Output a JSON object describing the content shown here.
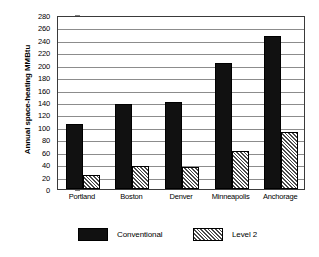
{
  "chart_data": {
    "type": "bar",
    "title": "",
    "xlabel": "",
    "ylabel": "Annual space-heating MMBtu",
    "ylabel_parts": {
      "text": "Annual space-heating",
      "unit": "MMBtu"
    },
    "categories": [
      "Portland",
      "Boston",
      "Denver",
      "Minneapolis",
      "Anchorage"
    ],
    "series": [
      {
        "name": "Conventional",
        "values": [
          105,
          137,
          140,
          202,
          246
        ],
        "pattern": "solid-black",
        "color": "#111111"
      },
      {
        "name": "Level 2",
        "values": [
          22,
          37,
          35,
          61,
          92
        ],
        "pattern": "diagonal-hatch",
        "color": "#4a4a4a"
      }
    ],
    "ylim": [
      0,
      280
    ],
    "ytick_step": 20,
    "yticks": [
      0,
      20,
      40,
      60,
      80,
      100,
      120,
      140,
      160,
      180,
      200,
      220,
      240,
      260,
      280
    ],
    "ytick_labels": [
      "0",
      "20",
      "40",
      "60",
      "80",
      "100",
      "120",
      "140",
      "160",
      "180",
      "200",
      "220",
      "240",
      "260",
      "280"
    ],
    "grid": true,
    "grid_axis": "y",
    "legend_position": "bottom",
    "legend": [
      "Conventional",
      "Level 2"
    ]
  }
}
